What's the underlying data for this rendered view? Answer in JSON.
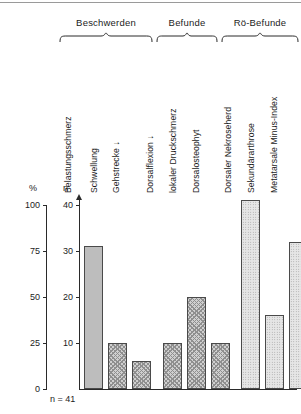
{
  "chart_data": {
    "type": "bar",
    "title": "",
    "subtitle": "",
    "xlabel": "",
    "ylabel": "%",
    "ylabel_secondary": "n",
    "ylim": [
      0,
      100
    ],
    "ylim_secondary": [
      0,
      41
    ],
    "grid": false,
    "legend": "none",
    "total_n_label": "n = 41",
    "total_n": 41,
    "axis_left": {
      "name": "%",
      "ticks": [
        "0",
        "25",
        "50",
        "75",
        "100"
      ],
      "tick_values": [
        0,
        25,
        50,
        75,
        100
      ]
    },
    "axis_right": {
      "name": "n",
      "ticks": [
        "0",
        "10",
        "20",
        "30",
        "40"
      ],
      "tick_values": [
        0,
        10,
        20,
        30,
        40
      ]
    },
    "groups": [
      {
        "label": "Beschwerden",
        "count": 3
      },
      {
        "label": "Befunde",
        "count": 3
      },
      {
        "label": "Rö-Befunde",
        "count": 3
      }
    ],
    "categories": [
      "Belastungsschmerz",
      "Schwellung",
      "Gehstrecke ↓",
      "Dorsalflexion ↓",
      "lokaler Druckschmerz",
      "Dorsalosteophyt",
      "Dorsaler Nekroseherd",
      "Sekundärarthrose",
      "Metatarsale Minus-Index"
    ],
    "values": [
      31,
      10,
      6,
      10,
      20,
      10,
      41,
      16,
      32
    ],
    "values_percent": [
      76,
      24,
      15,
      24,
      49,
      24,
      100,
      39,
      78
    ],
    "bars": [
      {
        "label": "Belastungsschmerz",
        "group": "Beschwerden",
        "n": 31,
        "percent": 76,
        "fill": "solid"
      },
      {
        "label": "Schwellung",
        "group": "Beschwerden",
        "n": 10,
        "percent": 24,
        "fill": "hatch"
      },
      {
        "label": "Gehstrecke ↓",
        "group": "Beschwerden",
        "n": 6,
        "percent": 15,
        "fill": "hatch"
      },
      {
        "label": "Dorsalflexion ↓",
        "group": "Befunde",
        "n": 10,
        "percent": 24,
        "fill": "hatch"
      },
      {
        "label": "lokaler Druckschmerz",
        "group": "Befunde",
        "n": 20,
        "percent": 49,
        "fill": "hatch"
      },
      {
        "label": "Dorsalosteophyt",
        "group": "Befunde",
        "n": 10,
        "percent": 24,
        "fill": "hatch"
      },
      {
        "label": "Dorsaler Nekroseherd",
        "group": "Rö-Befunde",
        "n": 41,
        "percent": 100,
        "fill": "dot"
      },
      {
        "label": "Sekundärarthrose",
        "group": "Rö-Befunde",
        "n": 16,
        "percent": 39,
        "fill": "dot"
      },
      {
        "label": "Metatarsale Minus-Index",
        "group": "Rö-Befunde",
        "n": 32,
        "percent": 78,
        "fill": "dot"
      }
    ],
    "colors": {
      "background": "#ffffff",
      "axis": "#2a2a2a",
      "text": "#1c1c1c",
      "bar_solid": "#bdbdbd",
      "bar_hatch": "#cfcfcf",
      "bar_dot": "#e6e6e6",
      "bar_outline": "#4a4a4a"
    }
  }
}
